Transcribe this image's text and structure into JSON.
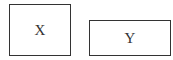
{
  "boxes": [
    {
      "label": "X"
    },
    {
      "label": "Y"
    }
  ],
  "colors": {
    "stroke": "#333333",
    "background": "#ffffff"
  }
}
